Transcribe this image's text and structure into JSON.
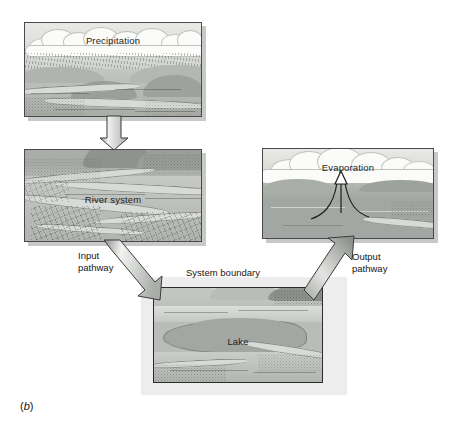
{
  "figure": {
    "caption_prefix": "(",
    "caption_letter": "b",
    "caption_suffix": ")",
    "caption_full": "(b)",
    "background_color": "#ffffff"
  },
  "diagram": {
    "type": "flow-diagram",
    "panels": [
      {
        "id": "precipitation",
        "label": "Precipitation",
        "role": "source",
        "scene": "rain falling from clouds over a river valley"
      },
      {
        "id": "river-system",
        "label": "River system",
        "role": "input-source",
        "scene": "aerial view of a braided river system with farmland"
      },
      {
        "id": "lake",
        "label": "Lake",
        "role": "system",
        "scene": "lake surrounded by hills, inside the system boundary"
      },
      {
        "id": "evaporation",
        "label": "Evaporation",
        "role": "sink",
        "scene": "vapour rising from lake surface into cumulus clouds"
      }
    ],
    "arrows": [
      {
        "id": "precipitation-to-river",
        "label": "",
        "from": "precipitation",
        "to": "river-system",
        "direction": "down"
      },
      {
        "id": "input-pathway",
        "label_line1": "Input",
        "label_line2": "pathway",
        "label": "Input pathway",
        "from": "river-system",
        "to": "lake",
        "direction": "down-right"
      },
      {
        "id": "output-pathway",
        "label_line1": "Output",
        "label_line2": "pathway",
        "label": "Output pathway",
        "from": "lake",
        "to": "evaporation",
        "direction": "up-right"
      }
    ],
    "boundary": {
      "id": "system-boundary",
      "label": "System boundary",
      "fill_color": "#ededed"
    },
    "colors": {
      "panel_border": "#4a4a4a",
      "arrow_outline": "#3b3b3b",
      "water": "#a3a7a3",
      "sky": "#e9eae6",
      "text": "#161616"
    }
  }
}
